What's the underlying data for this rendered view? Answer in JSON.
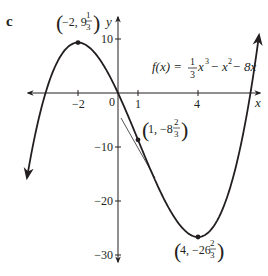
{
  "panel_label": "c",
  "function_label": {
    "prefix": "f(x) = ",
    "frac1_num": "1",
    "frac1_den": "3",
    "term1": "x",
    "exp1": "3",
    "term2": " − x",
    "exp2": "2",
    "term3": " − 8x"
  },
  "axes": {
    "x_label": "x",
    "y_label": "y",
    "origin_label": "0",
    "x_ticks": [
      "−2",
      "1",
      "4"
    ],
    "y_ticks": [
      "10",
      "−10",
      "−20",
      "−30"
    ]
  },
  "points": [
    {
      "name": "local-max",
      "pre": "−2, 9",
      "num": "1",
      "den": "3"
    },
    {
      "name": "inflection",
      "pre": "1, −8",
      "num": "2",
      "den": "3"
    },
    {
      "name": "local-min",
      "pre": "4, −26",
      "num": "2",
      "den": "3"
    }
  ],
  "colors": {
    "curve": "#231f20",
    "axes": "#231f20",
    "tangent": "#555555"
  },
  "chart_data": {
    "type": "line",
    "xlabel": "x",
    "ylabel": "y",
    "xlim": [
      -5,
      7.5
    ],
    "ylim": [
      -32,
      14
    ],
    "x_tick_labels": [
      -2,
      1,
      4
    ],
    "y_tick_labels": [
      10,
      -10,
      -20,
      -30
    ],
    "grid": false,
    "series": [
      {
        "name": "f(x)",
        "x": [
          -4.5,
          -4,
          -3,
          -2,
          -1,
          0,
          1,
          2,
          3,
          4,
          5,
          6,
          7
        ],
        "values": [
          -12.4,
          -5.3,
          6,
          9.33,
          7.67,
          0,
          -8.67,
          -17.33,
          -24,
          -26.67,
          -23.33,
          -12,
          8.33
        ]
      }
    ],
    "annotations": [
      {
        "label": "(-2, 9 1/3)",
        "x": -2,
        "y": 9.333,
        "kind": "local maximum"
      },
      {
        "label": "(1, -8 2/3)",
        "x": 1,
        "y": -8.667,
        "kind": "point of inflection with tangent"
      },
      {
        "label": "(4, -26 2/3)",
        "x": 4,
        "y": -26.667,
        "kind": "local minimum"
      }
    ]
  }
}
